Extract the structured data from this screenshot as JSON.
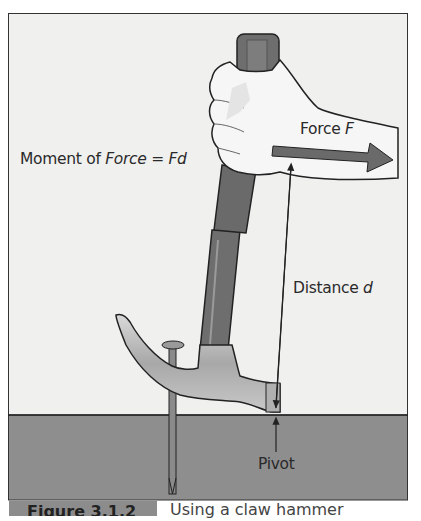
{
  "figure": {
    "labels": {
      "moment_prefix": "Moment of ",
      "moment_force": "Force",
      "moment_equals": " = ",
      "moment_fd": "Fd",
      "force_prefix": "Force ",
      "force_var": "F",
      "distance_prefix": "Distance ",
      "distance_var": "d",
      "pivot": "Pivot"
    },
    "caption": {
      "number": "Figure 3.1.2",
      "text": "Using a claw hammer"
    },
    "colors": {
      "background": "#f0f0ef",
      "ground": "#8e8e8e",
      "handle": "#6e6e6e",
      "arrow": "#6a6a6a",
      "hand": "#f6f6f6",
      "hammer_head": "#bdbdbd",
      "outline": "#2b2b2b"
    }
  }
}
